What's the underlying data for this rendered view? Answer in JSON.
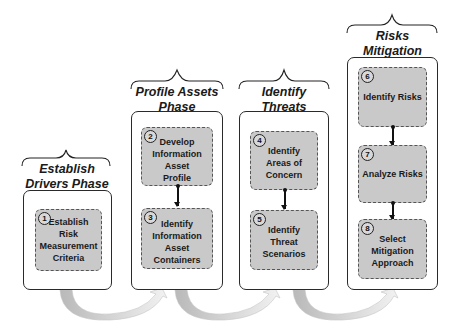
{
  "diagram": {
    "type": "phased process flow",
    "colors": {
      "step_fill": "#c9c9c9",
      "outer_border": "#2a2a2a",
      "transition_arrow": "#c8c8c8"
    },
    "phases": [
      {
        "title": "Establish Drivers Phase",
        "title_lines": [
          "Establish",
          "Drivers Phase"
        ],
        "steps": [
          {
            "number": "1",
            "label": "Establish Risk Measurement Criteria",
            "lines": [
              "Establish Risk",
              "Measurement",
              "Criteria"
            ]
          }
        ]
      },
      {
        "title": "Profile Assets Phase",
        "title_lines": [
          "Profile Assets",
          "Phase"
        ],
        "steps": [
          {
            "number": "2",
            "label": "Develop Information Asset Profile",
            "lines": [
              "Develop",
              "Information Asset",
              "Profile"
            ]
          },
          {
            "number": "3",
            "label": "Identify Information Asset Containers",
            "lines": [
              "Identify",
              "Information Asset",
              "Containers"
            ]
          }
        ]
      },
      {
        "title": "Identify Threats Phase",
        "title_lines": [
          "Identify Threats",
          "Phase"
        ],
        "steps": [
          {
            "number": "4",
            "label": "Identify Areas of Concern",
            "lines": [
              "Identify",
              "Areas of Concern"
            ]
          },
          {
            "number": "5",
            "label": "Identify Threat Scenarios",
            "lines": [
              "Identify",
              "Threat Scenarios"
            ]
          }
        ]
      },
      {
        "title": "Risks Mitigation Phase",
        "title_lines": [
          "Risks Mitigation",
          "Phase"
        ],
        "steps": [
          {
            "number": "6",
            "label": "Identify Risks",
            "lines": [
              "Identify Risks"
            ]
          },
          {
            "number": "7",
            "label": "Analyze Risks",
            "lines": [
              "Analyze Risks"
            ]
          },
          {
            "number": "8",
            "label": "Select Mitigation Approach",
            "lines": [
              "Select",
              "Mitigation",
              "Approach"
            ]
          }
        ]
      }
    ],
    "transitions": [
      {
        "from": "Establish Drivers Phase",
        "to": "Profile Assets Phase"
      },
      {
        "from": "Profile Assets Phase",
        "to": "Identify Threats Phase"
      },
      {
        "from": "Identify Threats Phase",
        "to": "Risks Mitigation Phase"
      }
    ]
  }
}
